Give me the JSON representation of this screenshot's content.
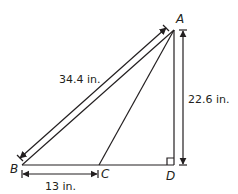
{
  "diagram": {
    "points": {
      "A": {
        "label": "A"
      },
      "B": {
        "label": "B"
      },
      "C": {
        "label": "C"
      },
      "D": {
        "label": "D"
      }
    },
    "dimensions": {
      "AB": "34.4 in.",
      "AD": "22.6 in.",
      "BC": "13 in."
    },
    "right_angle_at": "D",
    "line_color": "#231f20"
  }
}
